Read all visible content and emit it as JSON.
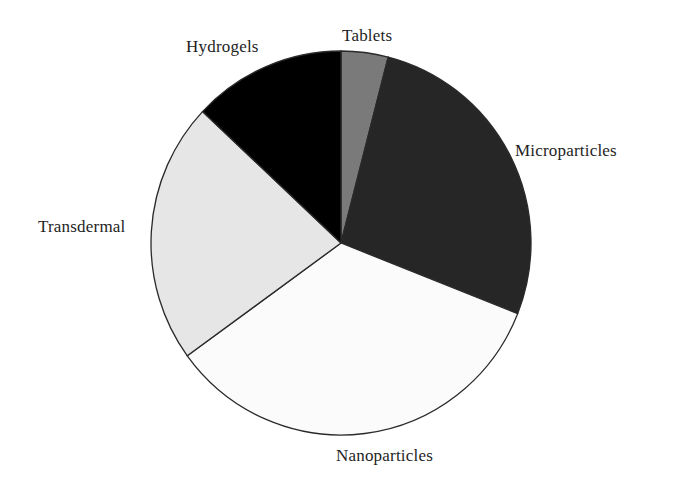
{
  "chart_data": {
    "type": "pie",
    "title": "",
    "start_angle_deg": 0,
    "direction": "clockwise",
    "legend": "none (direct labels)",
    "categories": [
      "Tablets",
      "Microparticles",
      "Nanoparticles",
      "Transdermal",
      "Hydrogels"
    ],
    "values": [
      4,
      27,
      34,
      22,
      13
    ],
    "colors": [
      "#7a7a7a",
      "#262626",
      "#fbfbfb",
      "#e6e6e6",
      "#000000"
    ],
    "units": "approx. percent (estimated from slice angles)"
  },
  "labels": {
    "tablets": "Tablets",
    "microparticles": "Microparticles",
    "nanoparticles": "Nanoparticles",
    "transdermal": "Transdermal",
    "hydrogels": "Hydrogels"
  }
}
